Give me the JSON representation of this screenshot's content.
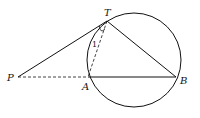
{
  "diagram": {
    "type": "geometry",
    "points": {
      "T": {
        "label": "T",
        "x": 107,
        "y": 21
      },
      "A": {
        "label": "A",
        "x": 88,
        "y": 77
      },
      "B": {
        "label": "B",
        "x": 176,
        "y": 77
      },
      "P": {
        "label": "P",
        "x": 18,
        "y": 77
      }
    },
    "circle": {
      "cx": 134,
      "cy": 60,
      "r": 47
    },
    "segments": [
      {
        "from": "P",
        "to": "T",
        "style": "solid"
      },
      {
        "from": "T",
        "to": "B",
        "style": "solid"
      },
      {
        "from": "A",
        "to": "B",
        "style": "solid"
      },
      {
        "from": "P",
        "to": "A",
        "style": "dashed"
      },
      {
        "from": "T",
        "to": "A",
        "style": "dashed"
      }
    ],
    "angle_label": "1",
    "colors": {
      "stroke": "#111111",
      "background": "#ffffff"
    }
  }
}
